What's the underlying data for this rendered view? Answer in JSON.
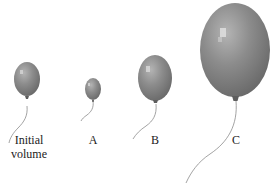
{
  "figure": {
    "background": "#ffffff",
    "balloon_color": "#8a8a8a",
    "balloon_highlight": "#d8d8d8",
    "balloon_shadow": "#5e5e5e",
    "string_color": "#8c8c8c"
  },
  "balloons": [
    {
      "id": "initial",
      "label_line1": "Initial",
      "label_line2": "volume",
      "cx": 27,
      "cy": 79,
      "rx": 13,
      "ry": 17
    },
    {
      "id": "A",
      "label_line1": "A",
      "label_line2": "",
      "cx": 93,
      "cy": 89,
      "rx": 8,
      "ry": 11
    },
    {
      "id": "B",
      "label_line1": "B",
      "label_line2": "",
      "cx": 155,
      "cy": 78,
      "rx": 17,
      "ry": 23
    },
    {
      "id": "C",
      "label_line1": "C",
      "label_line2": "",
      "cx": 235,
      "cy": 50,
      "rx": 35,
      "ry": 47
    }
  ]
}
